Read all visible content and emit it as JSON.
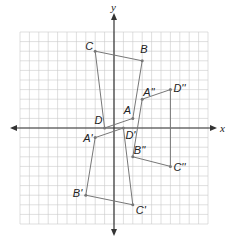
{
  "diagram": {
    "type": "coordinate-plane-transformations",
    "grid": {
      "xmin": -10,
      "xmax": 10,
      "ymin": -10,
      "ymax": 10,
      "origin_px": [
        114,
        128
      ],
      "cell_px": [
        9.4,
        9.6
      ],
      "grid_color": "#c9c9c9",
      "axis_color": "#333333",
      "shape_color": "#777777"
    },
    "axes": {
      "x_label": "x",
      "y_label": "y"
    },
    "figures": [
      {
        "name": "ABCD",
        "vertices": [
          {
            "label": "A",
            "x": 2,
            "y": 1,
            "lx": -9,
            "ly": -4
          },
          {
            "label": "B",
            "x": 3,
            "y": 7,
            "lx": -2,
            "ly": -8
          },
          {
            "label": "C",
            "x": -2,
            "y": 8,
            "lx": -10,
            "ly": -1
          },
          {
            "label": "D",
            "x": -1,
            "y": 0,
            "lx": -10,
            "ly": -4
          }
        ]
      },
      {
        "name": "A'B'C'D'",
        "vertices": [
          {
            "label": "A'",
            "x": -2,
            "y": -1,
            "lx": -12,
            "ly": 4
          },
          {
            "label": "B'",
            "x": -3,
            "y": -7,
            "lx": -13,
            "ly": 2
          },
          {
            "label": "C'",
            "x": 2,
            "y": -8,
            "lx": 3,
            "ly": 9
          },
          {
            "label": "D'",
            "x": 1,
            "y": 0,
            "lx": 2,
            "ly": 11
          }
        ]
      },
      {
        "name": "A''B''C''D''",
        "vertices": [
          {
            "label": "A''",
            "x": 3,
            "y": 3,
            "lx": 1,
            "ly": -3
          },
          {
            "label": "D''",
            "x": 6,
            "y": 4,
            "lx": 3,
            "ly": 2
          },
          {
            "label": "C''",
            "x": 6,
            "y": -4,
            "lx": 3,
            "ly": 5
          },
          {
            "label": "B''",
            "x": 2,
            "y": -3,
            "lx": 1,
            "ly": -3
          }
        ]
      }
    ]
  }
}
